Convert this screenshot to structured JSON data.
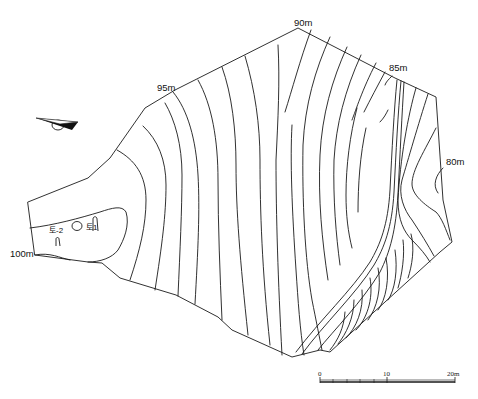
{
  "map": {
    "type": "topographic contour survey map",
    "contour_interval_m": 1,
    "elevation_labels": [
      {
        "id": "e90",
        "text": "90m"
      },
      {
        "id": "e95",
        "text": "95m"
      },
      {
        "id": "e85",
        "text": "85m"
      },
      {
        "id": "e80",
        "text": "80m"
      },
      {
        "id": "e100",
        "text": "100m"
      }
    ],
    "features": [
      {
        "id": "f1",
        "text": "토1"
      },
      {
        "id": "f2",
        "text": "토-2"
      }
    ],
    "north_arrow": {
      "icon": "north-arrow-icon"
    },
    "scale_bar": {
      "ticks": [
        "0",
        "10",
        "20m"
      ],
      "units": "m"
    }
  },
  "colors": {
    "line": "#1a1a1a",
    "background": "#ffffff"
  }
}
